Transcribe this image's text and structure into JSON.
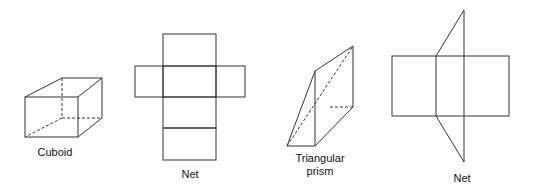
{
  "figures": [
    {
      "id": "cuboid",
      "label": "Cuboid"
    },
    {
      "id": "cuboid-net",
      "label": "Net"
    },
    {
      "id": "triangular-prism",
      "label_line1": "Triangular",
      "label_line2": "prism"
    },
    {
      "id": "prism-net",
      "label": "Net"
    }
  ],
  "colors": {
    "stroke": "#333333",
    "background": "#ffffff"
  }
}
